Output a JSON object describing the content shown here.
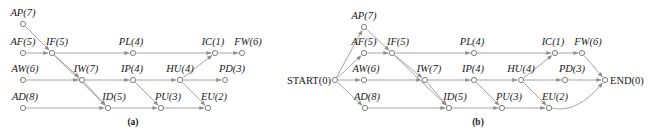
{
  "figure": {
    "captions": [
      {
        "text": "(a)",
        "x": 133,
        "y": 122
      },
      {
        "text": "(b)",
        "x": 478,
        "y": 122
      }
    ]
  },
  "chart_data": {
    "type": "diagram",
    "subtitle": "Panel (a) without terminal nodes, panel (b) with START and END nodes",
    "panels": [
      {
        "id": "a",
        "caption": "(a)",
        "nodes": [
          {
            "id": "AP",
            "label": "AP(7)",
            "duration": 7,
            "x": 23,
            "y": 24,
            "label_x": 23,
            "label_y": 18
          },
          {
            "id": "AF",
            "label": "AF(5)",
            "duration": 5,
            "x": 23,
            "y": 53,
            "label_x": 23,
            "label_y": 47
          },
          {
            "id": "IF",
            "label": "IF(5)",
            "duration": 5,
            "x": 52,
            "y": 53,
            "label_x": 57,
            "label_y": 47
          },
          {
            "id": "PL",
            "label": "PL(4)",
            "duration": 4,
            "x": 133,
            "y": 53,
            "label_x": 131,
            "label_y": 47
          },
          {
            "id": "IC",
            "label": "IC(1)",
            "duration": 1,
            "x": 215,
            "y": 53,
            "label_x": 213,
            "label_y": 47
          },
          {
            "id": "FW",
            "label": "FW(6)",
            "duration": 6,
            "x": 242,
            "y": 53,
            "label_x": 248,
            "label_y": 47
          },
          {
            "id": "AW",
            "label": "AW(6)",
            "duration": 6,
            "x": 23,
            "y": 80,
            "label_x": 25,
            "label_y": 74
          },
          {
            "id": "IW",
            "label": "IW(7)",
            "duration": 7,
            "x": 82,
            "y": 80,
            "label_x": 86,
            "label_y": 74
          },
          {
            "id": "IP",
            "label": "IP(4)",
            "duration": 4,
            "x": 133,
            "y": 80,
            "label_x": 132,
            "label_y": 74
          },
          {
            "id": "HU",
            "label": "HU(4)",
            "duration": 4,
            "x": 180,
            "y": 80,
            "label_x": 180,
            "label_y": 74
          },
          {
            "id": "PD",
            "label": "PD(3)",
            "duration": 3,
            "x": 225,
            "y": 80,
            "label_x": 232,
            "label_y": 74
          },
          {
            "id": "AD",
            "label": "AD(8)",
            "duration": 8,
            "x": 23,
            "y": 108,
            "label_x": 25,
            "label_y": 102
          },
          {
            "id": "ID",
            "label": "ID(5)",
            "duration": 5,
            "x": 108,
            "y": 108,
            "label_x": 114,
            "label_y": 102
          },
          {
            "id": "PU",
            "label": "PU(3)",
            "duration": 3,
            "x": 161,
            "y": 108,
            "label_x": 168,
            "label_y": 102
          },
          {
            "id": "EU",
            "label": "EU(2)",
            "duration": 2,
            "x": 208,
            "y": 108,
            "label_x": 214,
            "label_y": 102
          }
        ],
        "edges": [
          {
            "from": "AP",
            "to": "IF"
          },
          {
            "from": "AF",
            "to": "IF"
          },
          {
            "from": "IF",
            "to": "PL"
          },
          {
            "from": "PL",
            "to": "IC"
          },
          {
            "from": "IC",
            "to": "FW"
          },
          {
            "from": "IF",
            "to": "IW"
          },
          {
            "from": "AW",
            "to": "IW"
          },
          {
            "from": "IW",
            "to": "IP"
          },
          {
            "from": "IP",
            "to": "HU"
          },
          {
            "from": "HU",
            "to": "PD"
          },
          {
            "from": "HU",
            "to": "IC"
          },
          {
            "from": "IF",
            "to": "ID"
          },
          {
            "from": "IW",
            "to": "ID"
          },
          {
            "from": "AD",
            "to": "ID"
          },
          {
            "from": "ID",
            "to": "PU"
          },
          {
            "from": "IP",
            "to": "PU"
          },
          {
            "from": "PU",
            "to": "EU"
          },
          {
            "from": "HU",
            "to": "EU"
          }
        ],
        "terminals": []
      },
      {
        "id": "b",
        "caption": "(b)",
        "nodes": [
          {
            "id": "AP",
            "label": "AP(7)",
            "duration": 7,
            "x": 364,
            "y": 27,
            "label_x": 364,
            "label_y": 21
          },
          {
            "id": "AF",
            "label": "AF(5)",
            "duration": 5,
            "x": 364,
            "y": 53,
            "label_x": 364,
            "label_y": 47
          },
          {
            "id": "IF",
            "label": "IF(5)",
            "duration": 5,
            "x": 392,
            "y": 53,
            "label_x": 398,
            "label_y": 47
          },
          {
            "id": "PL",
            "label": "PL(4)",
            "duration": 4,
            "x": 474,
            "y": 53,
            "label_x": 472,
            "label_y": 47
          },
          {
            "id": "IC",
            "label": "IC(1)",
            "duration": 1,
            "x": 555,
            "y": 53,
            "label_x": 553,
            "label_y": 47
          },
          {
            "id": "FW",
            "label": "FW(6)",
            "duration": 6,
            "x": 582,
            "y": 53,
            "label_x": 588,
            "label_y": 47
          },
          {
            "id": "AW",
            "label": "AW(6)",
            "duration": 6,
            "x": 364,
            "y": 80,
            "label_x": 366,
            "label_y": 74
          },
          {
            "id": "IW",
            "label": "IW(7)",
            "duration": 7,
            "x": 425,
            "y": 80,
            "label_x": 429,
            "label_y": 74
          },
          {
            "id": "IP",
            "label": "IP(4)",
            "duration": 4,
            "x": 474,
            "y": 80,
            "label_x": 473,
            "label_y": 74
          },
          {
            "id": "HU",
            "label": "HU(4)",
            "duration": 4,
            "x": 521,
            "y": 80,
            "label_x": 521,
            "label_y": 74
          },
          {
            "id": "PD",
            "label": "PD(3)",
            "duration": 3,
            "x": 565,
            "y": 80,
            "label_x": 572,
            "label_y": 74
          },
          {
            "id": "AD",
            "label": "AD(8)",
            "duration": 8,
            "x": 365,
            "y": 108,
            "label_x": 367,
            "label_y": 102
          },
          {
            "id": "ID",
            "label": "ID(5)",
            "duration": 5,
            "x": 449,
            "y": 108,
            "label_x": 455,
            "label_y": 102
          },
          {
            "id": "PU",
            "label": "PU(3)",
            "duration": 3,
            "x": 502,
            "y": 108,
            "label_x": 509,
            "label_y": 102
          },
          {
            "id": "EU",
            "label": "EU(2)",
            "duration": 2,
            "x": 549,
            "y": 108,
            "label_x": 555,
            "label_y": 102
          },
          {
            "id": "START",
            "label": "START(0)",
            "duration": 0,
            "x": 335,
            "y": 80,
            "label_x": 331,
            "label_y": 80,
            "terminal": true,
            "label_side": "left"
          },
          {
            "id": "END",
            "label": "END(0)",
            "duration": 0,
            "x": 605,
            "y": 80,
            "label_x": 610,
            "label_y": 80,
            "terminal": true,
            "label_side": "right"
          }
        ],
        "edges": [
          {
            "from": "START",
            "to": "AP"
          },
          {
            "from": "START",
            "to": "AF"
          },
          {
            "from": "START",
            "to": "AW"
          },
          {
            "from": "START",
            "to": "AD"
          },
          {
            "from": "AP",
            "to": "IF"
          },
          {
            "from": "AF",
            "to": "IF"
          },
          {
            "from": "IF",
            "to": "PL"
          },
          {
            "from": "PL",
            "to": "IC"
          },
          {
            "from": "IC",
            "to": "FW"
          },
          {
            "from": "IF",
            "to": "IW"
          },
          {
            "from": "AW",
            "to": "IW"
          },
          {
            "from": "IW",
            "to": "IP"
          },
          {
            "from": "IP",
            "to": "HU"
          },
          {
            "from": "HU",
            "to": "PD"
          },
          {
            "from": "HU",
            "to": "IC"
          },
          {
            "from": "IF",
            "to": "ID"
          },
          {
            "from": "IW",
            "to": "ID"
          },
          {
            "from": "AD",
            "to": "ID"
          },
          {
            "from": "ID",
            "to": "PU"
          },
          {
            "from": "IP",
            "to": "PU"
          },
          {
            "from": "PU",
            "to": "EU"
          },
          {
            "from": "HU",
            "to": "EU"
          },
          {
            "from": "FW",
            "to": "END"
          },
          {
            "from": "PD",
            "to": "END"
          },
          {
            "from": "EU",
            "to": "END",
            "curve": 20
          }
        ],
        "terminals": [
          "START",
          "END"
        ]
      }
    ],
    "colors": {
      "edge": "#9a9a9a",
      "node_stroke": "#6f6f6f",
      "node_fill": "#ffffff",
      "text": "#1a1a1a",
      "background": "#ffffff"
    },
    "node_radius": 2.6
  }
}
